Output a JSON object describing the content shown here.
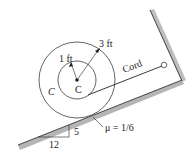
{
  "figure": {
    "labels": {
      "inner_radius": "1 ft",
      "outer_radius": "3 ft",
      "center": "C",
      "body": "C",
      "cord": "Cord",
      "friction": "μ = 1/6",
      "slope_rise": "5",
      "slope_run": "12"
    },
    "colors": {
      "line": "#222222",
      "surface_shade": "#b0b0b0"
    }
  }
}
